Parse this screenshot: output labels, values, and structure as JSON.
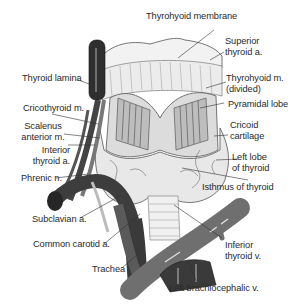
{
  "figure": {
    "type": "anatomical-illustration",
    "colors": {
      "vessel_dark": "#3a3a3a",
      "vessel_mid": "#6e6e6e",
      "tissue_light": "#e6e6e6",
      "line": "#333333",
      "background": "#ffffff"
    }
  },
  "labels": {
    "thyrohyoid_membrane": "Thyrohyoid membrane",
    "superior_thyroid_a": [
      "Superior",
      "thyroid a."
    ],
    "thyroid_lamina": "Thyroid lamina",
    "thyrohyoid_m": [
      "Thyrohyoid m.",
      "(divided)"
    ],
    "pyramidal_lobe": "Pyramidal lobe",
    "cricothyroid_m": "Cricothyroid m.",
    "cricoid_cartilage": [
      "Cricoid",
      "cartilage"
    ],
    "scalenus_anterior_m": [
      "Scalenus",
      "anterior m."
    ],
    "inferior_thyroid_a": [
      "Interior",
      "thyroid a."
    ],
    "left_lobe_of_thyroid": [
      "Left lobe",
      "of thyroid"
    ],
    "phrenic_n": "Phrenic n.",
    "isthmus_of_thyroid": "Isthmus of thyroid",
    "subclavian_a": "Subclavian a.",
    "inferior_thyroid_v": [
      "Inferior",
      "thyroid v."
    ],
    "common_carotid_a": "Common carotid a.",
    "trachea": "Trachea",
    "left_brachiocephalic_v": "Left brachiocephalic v."
  }
}
